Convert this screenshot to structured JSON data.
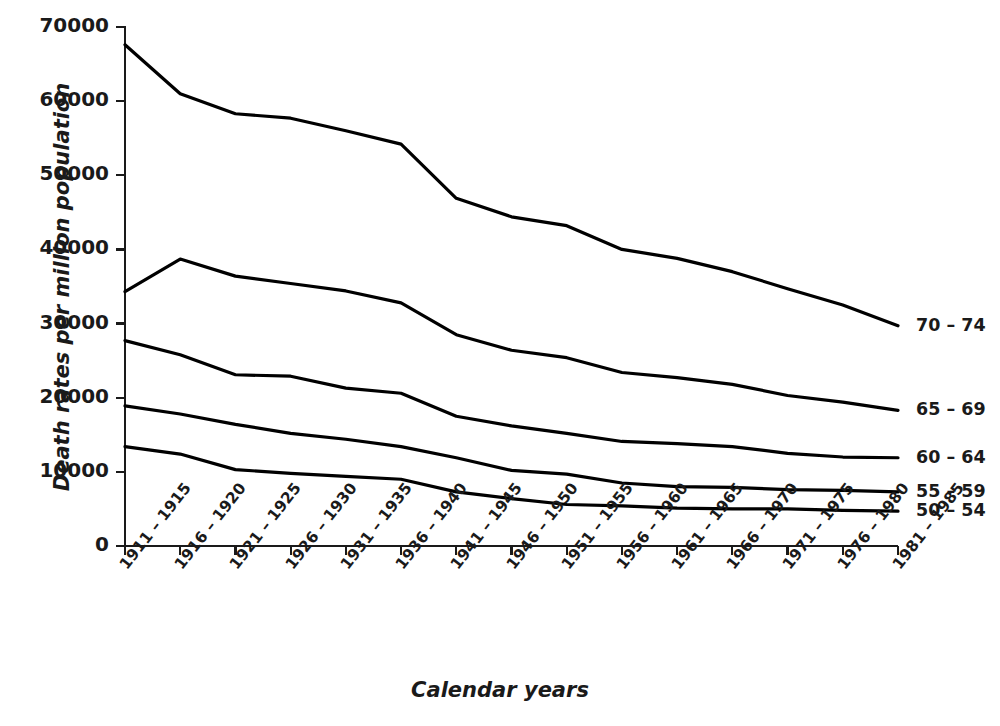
{
  "chart_data": {
    "type": "line",
    "title": "",
    "xlabel": "Calendar years",
    "ylabel": "Death rates per million population",
    "categories": [
      "1911 – 1915",
      "1916 – 1920",
      "1921 – 1925",
      "1926 – 1930",
      "1931 – 1935",
      "1936 – 1940",
      "1941 – 1945",
      "1946 – 1950",
      "1951 – 1955",
      "1956 – 1960",
      "1961 – 1965",
      "1966 – 1970",
      "1971 – 1975",
      "1976 – 1980",
      "1981 – 1985"
    ],
    "ylim": [
      0,
      70000
    ],
    "yticks": [
      0,
      10000,
      20000,
      30000,
      40000,
      50000,
      60000,
      70000
    ],
    "ytick_labels": [
      "0",
      "10000",
      "20000",
      "30000",
      "40000",
      "50000",
      "60000",
      "70000"
    ],
    "grid": false,
    "legend_position": "right-inline-end-of-line",
    "line_color": "#000000",
    "series": [
      {
        "name": "70 – 74",
        "label": "70 – 74",
        "values": [
          67600,
          61000,
          58300,
          57700,
          56000,
          54200,
          46900,
          44400,
          43200,
          40000,
          38800,
          37000,
          34700,
          32500,
          29700
        ]
      },
      {
        "name": "65 – 69",
        "label": "65 – 69",
        "values": [
          34300,
          38700,
          36400,
          35400,
          34400,
          32800,
          28500,
          26400,
          25400,
          23400,
          22700,
          21800,
          20300,
          19400,
          18300
        ]
      },
      {
        "name": "60 – 64",
        "label": "60 – 64",
        "values": [
          27700,
          25800,
          23100,
          22900,
          21300,
          20600,
          17500,
          16200,
          15200,
          14100,
          13800,
          13400,
          12500,
          12000,
          11900
        ]
      },
      {
        "name": "55 – 59",
        "label": "55 – 59",
        "values": [
          18900,
          17800,
          16400,
          15200,
          14400,
          13400,
          11900,
          10200,
          9700,
          8500,
          8000,
          7900,
          7600,
          7500,
          7300
        ]
      },
      {
        "name": "50 – 54",
        "label": "50 – 54",
        "values": [
          13400,
          12400,
          10300,
          9800,
          9400,
          9000,
          7300,
          6400,
          5600,
          5400,
          5100,
          5000,
          5000,
          4800,
          4700
        ]
      }
    ]
  }
}
